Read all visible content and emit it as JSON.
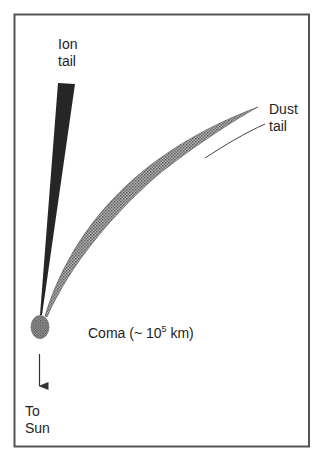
{
  "diagram": {
    "labels": {
      "ion_tail": [
        "Ion",
        "tail"
      ],
      "dust_tail": [
        "Dust",
        "tail"
      ],
      "to_sun": [
        "To",
        "Sun"
      ],
      "coma_prefix": "Coma (~ 10",
      "coma_exponent": "5",
      "coma_suffix": " km)"
    },
    "colors": {
      "frame": "#555555",
      "ion_tail": "#262626",
      "dust_tail_fill": "#9a9a9a",
      "dust_tail_edge": "#555555",
      "coma_fill": "#8c8c8c",
      "arrow": "#333333",
      "text": "#1e1e1e"
    },
    "elements": [
      "frame",
      "ion-tail",
      "dust-tail",
      "dust-tail-guide-line",
      "coma",
      "to-sun-arrow"
    ]
  }
}
